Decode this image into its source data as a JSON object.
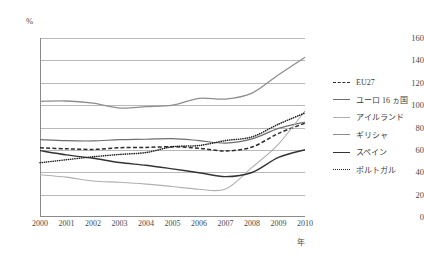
{
  "axes": {
    "y_unit": "%",
    "x_unit": "年",
    "y_ticks": [
      "0",
      "20",
      "40",
      "60",
      "80",
      "100",
      "120",
      "140",
      "160"
    ],
    "x_ticks": [
      "2000",
      "2001",
      "2002",
      "2003",
      "2004",
      "2005",
      "2006",
      "2007",
      "2008",
      "2009",
      "2010"
    ]
  },
  "legend": {
    "items": [
      {
        "label": "EU27",
        "style": "dashed",
        "color": "#2e2e2e"
      },
      {
        "label": "ユーロ 16 ヵ国",
        "style": "solid",
        "color": "#6e6e6e"
      },
      {
        "label": "アイルランド",
        "style": "solid",
        "color": "#b0b0b0"
      },
      {
        "label": "ギリシャ",
        "style": "solid",
        "color": "#8e8e8e"
      },
      {
        "label": "スペイン",
        "style": "solid",
        "color": "#333333"
      },
      {
        "label": "ポルトガル",
        "style": "dotted",
        "color": "#232323"
      }
    ]
  },
  "footnote": "",
  "chart_data": {
    "type": "line",
    "title": "",
    "xlabel": "年",
    "ylabel": "%",
    "xlim": [
      2000,
      2010
    ],
    "ylim": [
      0,
      160
    ],
    "ytick_step": 20,
    "grid": true,
    "legend_position": "right",
    "x": [
      2000,
      2001,
      2002,
      2003,
      2004,
      2005,
      2006,
      2007,
      2008,
      2009,
      2010
    ],
    "series": [
      {
        "name": "EU27",
        "values": [
          61.9,
          61.0,
          60.4,
          61.9,
          62.2,
          62.8,
          61.5,
          59.0,
          62.5,
          74.7,
          83.9
        ]
      },
      {
        "name": "ユーロ 16 ヵ国",
        "values": [
          69.2,
          68.2,
          68.0,
          69.1,
          69.5,
          70.1,
          68.3,
          66.0,
          69.8,
          79.2,
          84.9
        ]
      },
      {
        "name": "アイルランド",
        "values": [
          37.8,
          35.6,
          32.2,
          31.0,
          29.4,
          27.2,
          24.8,
          25.0,
          44.3,
          65.2,
          94.9
        ]
      },
      {
        "name": "ギリシャ",
        "values": [
          103.4,
          103.7,
          101.7,
          97.4,
          98.6,
          100.0,
          106.1,
          105.4,
          110.7,
          127.1,
          142.8
        ]
      },
      {
        "name": "スペイン",
        "values": [
          59.3,
          55.5,
          52.5,
          48.7,
          46.2,
          43.0,
          39.6,
          36.1,
          39.8,
          53.3,
          60.1
        ]
      },
      {
        "name": "ポルトガル",
        "values": [
          48.5,
          51.2,
          53.8,
          55.9,
          57.6,
          62.8,
          63.9,
          68.3,
          71.6,
          83.0,
          93.0
        ]
      }
    ]
  }
}
